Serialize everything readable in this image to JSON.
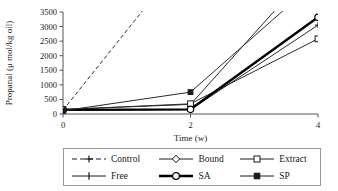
{
  "chart_data": {
    "type": "line",
    "title": "",
    "xlabel": "Time (w)",
    "ylabel": "Propanal (μ mol/kg oil)",
    "x": [
      0,
      2,
      4
    ],
    "xticks": [
      "0",
      "2",
      "4"
    ],
    "xlim": [
      0,
      4
    ],
    "ylim": [
      0,
      3500
    ],
    "yticks": [
      "0",
      "500",
      "1000",
      "1500",
      "2000",
      "2500",
      "3000",
      "3500"
    ],
    "ytick_values": [
      0,
      500,
      1000,
      1500,
      2000,
      2500,
      3000,
      3500
    ],
    "grid": false,
    "legend_position": "below",
    "series": [
      {
        "name": "Control",
        "values": [
          130,
          5600,
          null
        ],
        "marker": "plus",
        "line": "dashed",
        "width": 1,
        "clipped_above": true
      },
      {
        "name": "Bound",
        "values": [
          160,
          330,
          5200
        ],
        "marker": "diamond-open",
        "line": "solid",
        "width": 1,
        "clipped_above": true
      },
      {
        "name": "Extract",
        "values": [
          150,
          350,
          2580
        ],
        "marker": "square-open",
        "line": "solid",
        "width": 1,
        "clipped_above": false
      },
      {
        "name": "Free",
        "values": [
          120,
          150,
          3050
        ],
        "marker": "plus",
        "line": "solid",
        "width": 1,
        "clipped_above": false
      },
      {
        "name": "SA",
        "values": [
          140,
          160,
          3320
        ],
        "marker": "circle-open",
        "line": "solid",
        "width": 2.4,
        "clipped_above": false
      },
      {
        "name": "SP",
        "values": [
          110,
          750,
          4600
        ],
        "marker": "square-filled",
        "line": "solid",
        "width": 1,
        "clipped_above": true
      }
    ]
  },
  "legend": {
    "rows": [
      [
        {
          "label": "Control",
          "key": "dashed-plus-key"
        },
        {
          "label": "Bound",
          "key": "solid-diamond-key"
        },
        {
          "label": "Extract",
          "key": "solid-square-open-key"
        }
      ],
      [
        {
          "label": "Free",
          "key": "solid-plus-key"
        },
        {
          "label": "SA",
          "key": "thick-circle-key"
        },
        {
          "label": "SP",
          "key": "solid-square-filled-key"
        }
      ]
    ]
  }
}
